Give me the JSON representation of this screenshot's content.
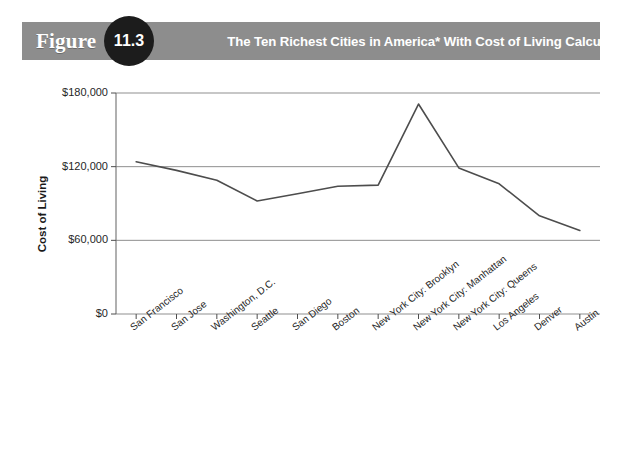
{
  "header": {
    "figure_word": "Figure",
    "figure_number": "11.3",
    "title": "The Ten Richest Cities in America* With Cost of Living Calculations**",
    "bar_color": "#8d8d8d",
    "badge_color": "#1c1c1c",
    "text_color": "#ffffff"
  },
  "chart_data": {
    "type": "line",
    "title": "The Ten Richest Cities in America* With Cost of Living Calculations**",
    "xlabel": "",
    "ylabel": "Cost of Living",
    "ylim": [
      0,
      180000
    ],
    "yticks": [
      0,
      60000,
      120000,
      180000
    ],
    "ytick_labels": [
      "$0",
      "$60,000",
      "$120,000",
      "$180,000"
    ],
    "grid": true,
    "grid_axis": "y",
    "legend": false,
    "line_color": "#4d4d4d",
    "categories": [
      "San Francisco",
      "San Jose",
      "Washington, D.C.",
      "Seattle",
      "San Diego",
      "Boston",
      "New York City: Brooklyn",
      "New York City: Manhattan",
      "New York City: Queens",
      "Los Angeles",
      "Denver",
      "Austin"
    ],
    "values": [
      124000,
      117000,
      109000,
      92000,
      98000,
      104000,
      105000,
      171000,
      119000,
      106000,
      80000,
      68000
    ]
  }
}
